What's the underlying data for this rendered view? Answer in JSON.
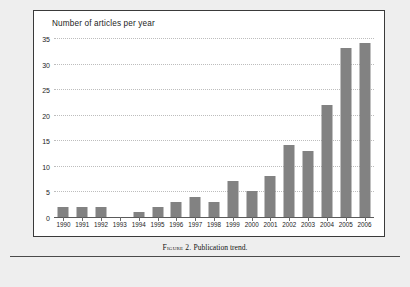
{
  "figure": {
    "caption_prefix": "Figure 2.",
    "caption_text": "Publication trend."
  },
  "chart_data": {
    "type": "bar",
    "title": "Number of articles per year",
    "xlabel": "",
    "ylabel": "",
    "ylim": [
      0,
      35
    ],
    "yticks": [
      "0",
      "5",
      "10",
      "15",
      "20",
      "25",
      "30",
      "35"
    ],
    "ytick_values": [
      0,
      5,
      10,
      15,
      20,
      25,
      30,
      35
    ],
    "grid": "horizontal-dotted",
    "legend": "none",
    "bar_color": "#828282",
    "categories": [
      "1990",
      "1991",
      "1992",
      "1993",
      "1994",
      "1995",
      "1996",
      "1997",
      "1998",
      "1999",
      "2000",
      "2001",
      "2002",
      "2003",
      "2004",
      "2005",
      "2006"
    ],
    "values": [
      2,
      2,
      2,
      0,
      1,
      2,
      3,
      4,
      3,
      7,
      5,
      8,
      14,
      13,
      22,
      33,
      34
    ]
  }
}
